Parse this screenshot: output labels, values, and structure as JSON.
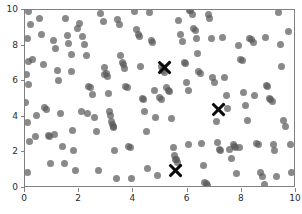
{
  "chart_data": {
    "type": "scatter",
    "title": "",
    "xlabel": "",
    "ylabel": "",
    "xlim": [
      0,
      10
    ],
    "ylim": [
      0,
      10
    ],
    "grid": false,
    "legend": null,
    "xticks": [
      0,
      2,
      4,
      6,
      8,
      10
    ],
    "yticks": [
      0,
      2,
      4,
      6,
      8,
      10
    ],
    "xticklabels": [
      "0",
      "2",
      "4",
      "6",
      "8",
      "10"
    ],
    "yticklabels": [
      "0",
      "2",
      "4",
      "6",
      "8",
      "10"
    ],
    "series": [
      {
        "name": "data points",
        "marker": "circle",
        "color": "#5c5c5c",
        "alpha": 0.72,
        "size": 7,
        "points": [
          [
            0.12,
            9.92
          ],
          [
            0.2,
            9.2
          ],
          [
            0.1,
            8.4
          ],
          [
            0.12,
            7.12
          ],
          [
            0.28,
            7.22
          ],
          [
            0.05,
            6.35
          ],
          [
            0.12,
            5.82
          ],
          [
            0.02,
            4.82
          ],
          [
            0.1,
            3.68
          ],
          [
            0.18,
            2.6
          ],
          [
            0.08,
            0.88
          ],
          [
            0.42,
            4.08
          ],
          [
            0.55,
            9.52
          ],
          [
            0.62,
            8.6
          ],
          [
            0.7,
            6.95
          ],
          [
            0.72,
            4.55
          ],
          [
            0.78,
            4.42
          ],
          [
            0.85,
            2.95
          ],
          [
            0.9,
            2.88
          ],
          [
            0.95,
            1.4
          ],
          [
            1.05,
            8.28
          ],
          [
            1.12,
            7.85
          ],
          [
            1.2,
            6.62
          ],
          [
            1.22,
            6.02
          ],
          [
            1.3,
            4.18
          ],
          [
            1.38,
            2.32
          ],
          [
            1.45,
            1.38
          ],
          [
            1.5,
            9.52
          ],
          [
            1.55,
            8.58
          ],
          [
            1.62,
            8.1
          ],
          [
            1.7,
            7.52
          ],
          [
            1.72,
            6.55
          ],
          [
            1.75,
            3.25
          ],
          [
            1.8,
            2.08
          ],
          [
            1.85,
            1.0
          ],
          [
            1.95,
            8.95
          ],
          [
            2.02,
            9.22
          ],
          [
            2.12,
            8.52
          ],
          [
            2.2,
            8.05
          ],
          [
            2.28,
            7.45
          ],
          [
            2.35,
            5.7
          ],
          [
            2.42,
            5.62
          ],
          [
            2.48,
            5.25
          ],
          [
            2.55,
            3.98
          ],
          [
            2.62,
            3.2
          ],
          [
            2.7,
            1.0
          ],
          [
            2.8,
            9.82
          ],
          [
            2.88,
            9.35
          ],
          [
            2.92,
            6.75
          ],
          [
            2.95,
            6.4
          ],
          [
            3.0,
            6.45
          ],
          [
            3.05,
            6.28
          ],
          [
            3.08,
            5.3
          ],
          [
            3.12,
            4.28
          ],
          [
            3.15,
            4.05
          ],
          [
            3.18,
            3.72
          ],
          [
            3.22,
            3.55
          ],
          [
            3.25,
            3.45
          ],
          [
            3.28,
            3.4
          ],
          [
            3.32,
            2.1
          ],
          [
            3.38,
            0.52
          ],
          [
            3.42,
            9.48
          ],
          [
            3.48,
            9.18
          ],
          [
            3.52,
            7.42
          ],
          [
            3.58,
            7.05
          ],
          [
            3.62,
            6.92
          ],
          [
            3.68,
            6.7
          ],
          [
            3.72,
            5.7
          ],
          [
            3.78,
            5.62
          ],
          [
            3.82,
            2.35
          ],
          [
            3.88,
            2.28
          ],
          [
            3.92,
            0.52
          ],
          [
            4.05,
            9.92
          ],
          [
            4.12,
            8.9
          ],
          [
            4.18,
            8.65
          ],
          [
            4.22,
            8.52
          ],
          [
            4.28,
            6.82
          ],
          [
            4.32,
            5.02
          ],
          [
            4.38,
            4.95
          ],
          [
            4.42,
            4.32
          ],
          [
            4.48,
            3.18
          ],
          [
            4.52,
            1.08
          ],
          [
            4.58,
            9.88
          ],
          [
            4.65,
            8.3
          ],
          [
            4.72,
            8.15
          ],
          [
            4.78,
            5.5
          ],
          [
            4.82,
            3.95
          ],
          [
            4.88,
            0.72
          ],
          [
            5.02,
            6.82
          ],
          [
            5.08,
            6.62
          ],
          [
            5.15,
            6.48
          ],
          [
            5.22,
            5.62
          ],
          [
            5.28,
            5.48
          ],
          [
            5.35,
            5.42
          ],
          [
            5.42,
            3.92
          ],
          [
            5.48,
            2.25
          ],
          [
            5.52,
            1.85
          ],
          [
            5.55,
            1.6
          ],
          [
            5.58,
            1.58
          ],
          [
            5.62,
            1.45
          ],
          [
            5.68,
            9.42
          ],
          [
            5.75,
            8.62
          ],
          [
            5.82,
            8.22
          ],
          [
            5.88,
            7.05
          ],
          [
            5.92,
            6.98
          ],
          [
            5.95,
            5.95
          ],
          [
            6.02,
            5.48
          ],
          [
            6.08,
            10.0
          ],
          [
            6.12,
            9.95
          ],
          [
            6.18,
            9.72
          ],
          [
            6.22,
            8.95
          ],
          [
            6.28,
            8.85
          ],
          [
            6.32,
            8.42
          ],
          [
            6.38,
            7.55
          ],
          [
            6.42,
            6.52
          ],
          [
            6.48,
            6.45
          ],
          [
            6.52,
            2.48
          ],
          [
            6.58,
            1.25
          ],
          [
            6.62,
            0.32
          ],
          [
            6.68,
            0.28
          ],
          [
            6.72,
            0.15
          ],
          [
            6.78,
            9.72
          ],
          [
            6.82,
            9.55
          ],
          [
            6.88,
            8.42
          ],
          [
            6.92,
            6.22
          ],
          [
            6.98,
            5.92
          ],
          [
            7.05,
            3.75
          ],
          [
            7.12,
            2.55
          ],
          [
            7.18,
            2.18
          ],
          [
            7.22,
            2.12
          ],
          [
            7.28,
            8.48
          ],
          [
            7.35,
            6.18
          ],
          [
            7.42,
            5.2
          ],
          [
            7.48,
            4.48
          ],
          [
            7.55,
            2.18
          ],
          [
            7.62,
            1.68
          ],
          [
            7.68,
            2.42
          ],
          [
            7.72,
            2.35
          ],
          [
            7.78,
            2.3
          ],
          [
            7.82,
            0.82
          ],
          [
            7.88,
            8.02
          ],
          [
            7.95,
            7.2
          ],
          [
            8.02,
            7.15
          ],
          [
            8.08,
            5.35
          ],
          [
            8.15,
            4.65
          ],
          [
            8.22,
            3.82
          ],
          [
            8.28,
            8.42
          ],
          [
            8.35,
            8.35
          ],
          [
            8.42,
            8.18
          ],
          [
            8.48,
            5.18
          ],
          [
            8.55,
            2.52
          ],
          [
            8.62,
            2.45
          ],
          [
            8.68,
            0.88
          ],
          [
            8.75,
            0.62
          ],
          [
            8.82,
            0.22
          ],
          [
            8.88,
            8.48
          ],
          [
            8.92,
            5.75
          ],
          [
            8.95,
            5.68
          ],
          [
            9.02,
            5.02
          ],
          [
            9.05,
            4.98
          ],
          [
            9.12,
            4.88
          ],
          [
            9.18,
            2.42
          ],
          [
            9.22,
            2.12
          ],
          [
            9.28,
            0.62
          ],
          [
            9.35,
            9.88
          ],
          [
            9.42,
            8.05
          ],
          [
            9.48,
            6.85
          ],
          [
            9.55,
            3.78
          ],
          [
            9.62,
            3.48
          ],
          [
            9.72,
            8.78
          ],
          [
            9.78,
            2.42
          ],
          [
            9.85,
            0.88
          ],
          [
            0.38,
            2.92
          ],
          [
            1.08,
            3.02
          ],
          [
            2.08,
            4.28
          ],
          [
            2.32,
            4.18
          ],
          [
            4.95,
            5.08
          ],
          [
            5.05,
            4.98
          ],
          [
            6.05,
            2.42
          ],
          [
            7.92,
            2.28
          ]
        ]
      }
    ],
    "centroids": {
      "name": "cluster centers",
      "marker": "x",
      "color": "#0b0b0b",
      "size": 17,
      "points": [
        [
          5.14,
          6.76
        ],
        [
          7.13,
          4.41
        ],
        [
          5.55,
          1.0
        ]
      ]
    }
  },
  "axes_style": {
    "spine_color": "#808080",
    "tick_color": "#808080",
    "label_color": "#2b2b2b",
    "background": "#ffffff"
  }
}
